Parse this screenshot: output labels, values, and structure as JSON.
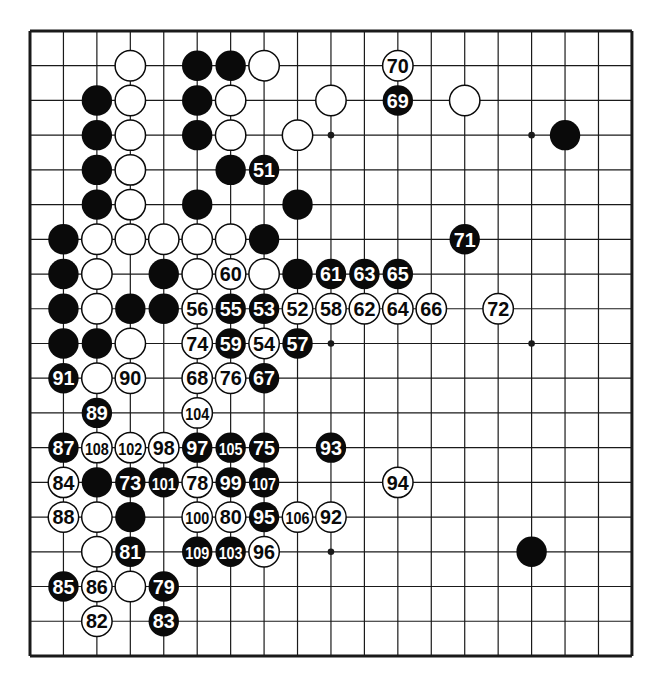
{
  "board": {
    "size": 19,
    "origin": {
      "x": 30,
      "y": 31
    },
    "spacing": {
      "x": 33.44,
      "y": 34.72
    },
    "colors": {
      "line": "#1a1a1a",
      "black": "#0a0a0a",
      "white": "#ffffff",
      "background": "#ffffff"
    },
    "star_points": [
      [
        3,
        3
      ],
      [
        9,
        3
      ],
      [
        15,
        3
      ],
      [
        3,
        9
      ],
      [
        9,
        9
      ],
      [
        15,
        9
      ],
      [
        3,
        15
      ],
      [
        9,
        15
      ],
      [
        15,
        15
      ]
    ]
  },
  "stones": {
    "black": [
      [
        5,
        1
      ],
      [
        6,
        1
      ],
      [
        2,
        2
      ],
      [
        5,
        2
      ],
      [
        2,
        3
      ],
      [
        5,
        3
      ],
      [
        16,
        3
      ],
      [
        2,
        4
      ],
      [
        6,
        4
      ],
      [
        2,
        5
      ],
      [
        5,
        5
      ],
      [
        8,
        5
      ],
      [
        1,
        6
      ],
      [
        7,
        6
      ],
      [
        1,
        7
      ],
      [
        4,
        7
      ],
      [
        8,
        7
      ],
      [
        1,
        8
      ],
      [
        3,
        8
      ],
      [
        4,
        8
      ],
      [
        1,
        9
      ],
      [
        2,
        9
      ],
      [
        2,
        13
      ],
      [
        3,
        14
      ],
      [
        15,
        15
      ]
    ],
    "white": [
      [
        3,
        1
      ],
      [
        7,
        1
      ],
      [
        3,
        2
      ],
      [
        6,
        2
      ],
      [
        9,
        2
      ],
      [
        13,
        2
      ],
      [
        3,
        3
      ],
      [
        6,
        3
      ],
      [
        8,
        3
      ],
      [
        3,
        4
      ],
      [
        3,
        5
      ],
      [
        2,
        6
      ],
      [
        3,
        6
      ],
      [
        4,
        6
      ],
      [
        5,
        6
      ],
      [
        6,
        6
      ],
      [
        2,
        7
      ],
      [
        5,
        7
      ],
      [
        7,
        7
      ],
      [
        2,
        8
      ],
      [
        3,
        9
      ],
      [
        2,
        10
      ],
      [
        2,
        14
      ],
      [
        2,
        15
      ],
      [
        3,
        16
      ]
    ]
  },
  "moves": [
    {
      "n": "51",
      "color": "black",
      "x": 7,
      "y": 4
    },
    {
      "n": "52",
      "color": "white",
      "x": 8,
      "y": 8
    },
    {
      "n": "53",
      "color": "black",
      "x": 7,
      "y": 8
    },
    {
      "n": "54",
      "color": "white",
      "x": 7,
      "y": 9
    },
    {
      "n": "55",
      "color": "black",
      "x": 6,
      "y": 8
    },
    {
      "n": "56",
      "color": "white",
      "x": 5,
      "y": 8
    },
    {
      "n": "57",
      "color": "black",
      "x": 8,
      "y": 9
    },
    {
      "n": "58",
      "color": "white",
      "x": 9,
      "y": 8
    },
    {
      "n": "59",
      "color": "black",
      "x": 6,
      "y": 9
    },
    {
      "n": "60",
      "color": "white",
      "x": 6,
      "y": 7
    },
    {
      "n": "61",
      "color": "black",
      "x": 9,
      "y": 7
    },
    {
      "n": "62",
      "color": "white",
      "x": 10,
      "y": 8
    },
    {
      "n": "63",
      "color": "black",
      "x": 10,
      "y": 7
    },
    {
      "n": "64",
      "color": "white",
      "x": 11,
      "y": 8
    },
    {
      "n": "65",
      "color": "black",
      "x": 11,
      "y": 7
    },
    {
      "n": "66",
      "color": "white",
      "x": 12,
      "y": 8
    },
    {
      "n": "67",
      "color": "black",
      "x": 7,
      "y": 10
    },
    {
      "n": "68",
      "color": "white",
      "x": 5,
      "y": 10
    },
    {
      "n": "69",
      "color": "black",
      "x": 11,
      "y": 2
    },
    {
      "n": "70",
      "color": "white",
      "x": 11,
      "y": 1
    },
    {
      "n": "71",
      "color": "black",
      "x": 13,
      "y": 6
    },
    {
      "n": "72",
      "color": "white",
      "x": 14,
      "y": 8
    },
    {
      "n": "73",
      "color": "black",
      "x": 3,
      "y": 13
    },
    {
      "n": "74",
      "color": "white",
      "x": 5,
      "y": 9
    },
    {
      "n": "75",
      "color": "black",
      "x": 7,
      "y": 12
    },
    {
      "n": "76",
      "color": "white",
      "x": 6,
      "y": 10
    },
    {
      "n": "78",
      "color": "white",
      "x": 5,
      "y": 13
    },
    {
      "n": "79",
      "color": "black",
      "x": 4,
      "y": 16
    },
    {
      "n": "80",
      "color": "white",
      "x": 6,
      "y": 14
    },
    {
      "n": "81",
      "color": "black",
      "x": 3,
      "y": 15
    },
    {
      "n": "82",
      "color": "white",
      "x": 2,
      "y": 17
    },
    {
      "n": "83",
      "color": "black",
      "x": 4,
      "y": 17
    },
    {
      "n": "84",
      "color": "white",
      "x": 1,
      "y": 13
    },
    {
      "n": "85",
      "color": "black",
      "x": 1,
      "y": 16
    },
    {
      "n": "86",
      "color": "white",
      "x": 2,
      "y": 16
    },
    {
      "n": "87",
      "color": "black",
      "x": 1,
      "y": 12
    },
    {
      "n": "88",
      "color": "white",
      "x": 1,
      "y": 14
    },
    {
      "n": "89",
      "color": "black",
      "x": 2,
      "y": 11
    },
    {
      "n": "90",
      "color": "white",
      "x": 3,
      "y": 10
    },
    {
      "n": "91",
      "color": "black",
      "x": 1,
      "y": 10
    },
    {
      "n": "92",
      "color": "white",
      "x": 9,
      "y": 14
    },
    {
      "n": "93",
      "color": "black",
      "x": 9,
      "y": 12
    },
    {
      "n": "94",
      "color": "white",
      "x": 11,
      "y": 13
    },
    {
      "n": "95",
      "color": "black",
      "x": 7,
      "y": 14
    },
    {
      "n": "96",
      "color": "white",
      "x": 7,
      "y": 15
    },
    {
      "n": "97",
      "color": "black",
      "x": 5,
      "y": 12
    },
    {
      "n": "98",
      "color": "white",
      "x": 4,
      "y": 12
    },
    {
      "n": "99",
      "color": "black",
      "x": 6,
      "y": 13
    },
    {
      "n": "100",
      "color": "white",
      "x": 5,
      "y": 14
    },
    {
      "n": "101",
      "color": "black",
      "x": 4,
      "y": 13
    },
    {
      "n": "102",
      "color": "white",
      "x": 3,
      "y": 12
    },
    {
      "n": "103",
      "color": "black",
      "x": 6,
      "y": 15
    },
    {
      "n": "104",
      "color": "white",
      "x": 5,
      "y": 11
    },
    {
      "n": "105",
      "color": "black",
      "x": 6,
      "y": 12
    },
    {
      "n": "106",
      "color": "white",
      "x": 8,
      "y": 14
    },
    {
      "n": "107",
      "color": "black",
      "x": 7,
      "y": 13
    },
    {
      "n": "108",
      "color": "white",
      "x": 2,
      "y": 12
    },
    {
      "n": "109",
      "color": "black",
      "x": 5,
      "y": 15
    }
  ]
}
